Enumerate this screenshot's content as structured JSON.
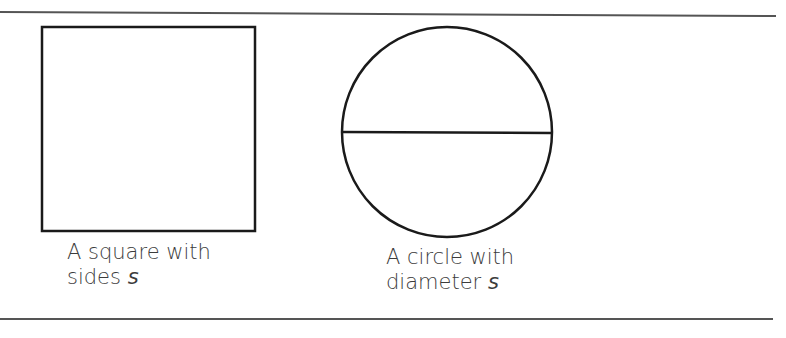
{
  "figure": {
    "shapes": [
      {
        "type": "square",
        "caption_line1": "A square with",
        "caption_line2_text": "sides ",
        "caption_line2_var": "s"
      },
      {
        "type": "circle",
        "caption_line1": "A circle with",
        "caption_line2_text": "diameter ",
        "caption_line2_var": "s"
      }
    ],
    "colors": {
      "stroke": "#1a1a1a",
      "rule": "#555555",
      "text": "#3c3c3c"
    }
  }
}
